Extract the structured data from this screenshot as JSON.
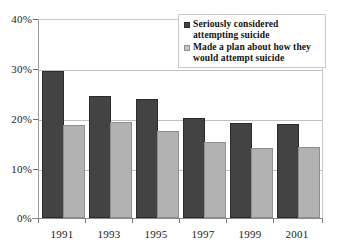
{
  "chart_data": {
    "type": "bar",
    "title": "",
    "subtitle": "",
    "xlabel": "",
    "ylabel": "",
    "categories": [
      "1991",
      "1993",
      "1995",
      "1997",
      "1999",
      "2001"
    ],
    "series": [
      {
        "name": "Seriously considered attempting suicide",
        "color": "#434343",
        "values": [
          29.5,
          24.5,
          24.0,
          20.1,
          19.0,
          18.8
        ]
      },
      {
        "name": "Made a plan about how they would attempt suicide",
        "color": "#b2b2b2",
        "values": [
          18.7,
          19.3,
          17.5,
          15.3,
          14.1,
          14.3
        ]
      }
    ],
    "ylim": [
      0,
      40
    ],
    "yticks": [
      0,
      10,
      20,
      30,
      40
    ],
    "ytick_labels": [
      "0%",
      "10%",
      "20%",
      "30%",
      "40%"
    ],
    "grid": true,
    "grid_axis": "y",
    "legend_position": "top-right"
  },
  "legend": {
    "items": [
      {
        "label": "Seriously considered attempting suicide",
        "swatch": "dark-square-icon"
      },
      {
        "label": "Made a plan about how they would attempt suicide",
        "swatch": "light-square-icon"
      }
    ]
  }
}
